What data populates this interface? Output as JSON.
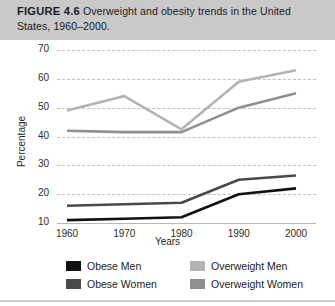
{
  "caption": {
    "figure_label": "FIGURE 4.6",
    "text": "Overweight and obesity trends in the United States, 1960–2000."
  },
  "chart_data": {
    "type": "line",
    "title": "Overweight and obesity trends in the United States, 1960–2000.",
    "xlabel": "Years",
    "ylabel": "Percentage",
    "x": [
      1960,
      1970,
      1980,
      1990,
      2000
    ],
    "categories": [
      "1960",
      "1970",
      "1980",
      "1990",
      "2000"
    ],
    "xlim": [
      1960,
      2000
    ],
    "ylim": [
      10,
      70
    ],
    "yticks": [
      10,
      20,
      30,
      40,
      50,
      60,
      70
    ],
    "grid": true,
    "legend_position": "bottom",
    "series": [
      {
        "name": "Obese Men",
        "color": "#111111",
        "values": [
          11,
          11.5,
          12,
          20,
          22
        ]
      },
      {
        "name": "Obese Women",
        "color": "#4a4a4a",
        "values": [
          16,
          16.5,
          17,
          25,
          26.5
        ]
      },
      {
        "name": "Overweight Men",
        "color": "#b4b4b4",
        "values": [
          49,
          54,
          42.5,
          59,
          63
        ]
      },
      {
        "name": "Overweight Women",
        "color": "#8f8f8f",
        "values": [
          42,
          41.5,
          41.5,
          50,
          55
        ]
      }
    ]
  },
  "legend": {
    "entries": [
      {
        "label": "Obese Men",
        "color": "#111111"
      },
      {
        "label": "Obese Women",
        "color": "#4a4a4a"
      },
      {
        "label": "Overweight Men",
        "color": "#b4b4b4"
      },
      {
        "label": "Overweight Women",
        "color": "#8f8f8f"
      }
    ]
  },
  "colors": {
    "caption_band": "#c9c9c9",
    "plot_background": "#ffffff",
    "gridline": "#c0c0c0",
    "axis": "#b8b8b8",
    "text": "#1b1b1b"
  }
}
